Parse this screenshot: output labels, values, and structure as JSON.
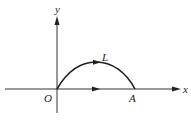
{
  "figure": {
    "axes": {
      "x_label": "x",
      "y_label": "y"
    },
    "points": {
      "origin": "O",
      "a": "A"
    },
    "curve": {
      "label": "L",
      "description": "arc from O to A above the x-axis, oriented with arrow toward A"
    },
    "segment": {
      "description": "segment from O to A along x-axis with arrow toward A"
    },
    "colors": {
      "stroke": "#222222",
      "background": "#ffffff"
    }
  }
}
